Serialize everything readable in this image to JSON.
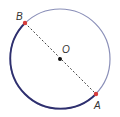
{
  "diagram": {
    "type": "circle-diameter",
    "circle": {
      "cx": 60,
      "cy": 59,
      "r": 50,
      "stroke": "#8a8fb8",
      "highlight_arc_stroke": "#2e2f6e"
    },
    "center": {
      "label": "O",
      "x": 60,
      "y": 59,
      "color": "#111111"
    },
    "points": [
      {
        "label": "B",
        "x": 25,
        "y": 23,
        "color": "#d63c3c"
      },
      {
        "label": "A",
        "x": 96,
        "y": 94,
        "color": "#d63c3c"
      }
    ],
    "diameter": {
      "from": "B",
      "to": "A",
      "style": "dashed",
      "color": "#444444"
    }
  }
}
